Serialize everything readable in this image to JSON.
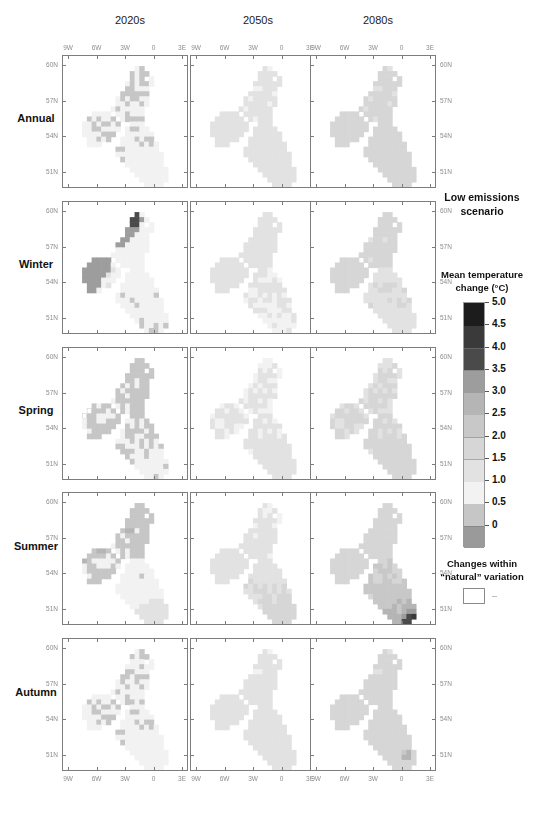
{
  "figure": {
    "columns": [
      "2020s",
      "2050s",
      "2080s"
    ],
    "rows": [
      "Annual",
      "Winter",
      "Spring",
      "Summer",
      "Autumn"
    ],
    "x_ticks": [
      "9W",
      "6W",
      "3W",
      "0",
      "3E"
    ],
    "y_ticks": [
      "60N",
      "57N",
      "54N",
      "51N"
    ]
  },
  "legend": {
    "scenario_line1": "Low emissions",
    "scenario_line2": "scenario",
    "colorbar_title_line1": "Mean temperature",
    "colorbar_title_line2": "change (°C)",
    "colorbar_labels": [
      "5.0",
      "4.5",
      "4.0",
      "3.5",
      "3.0",
      "2.5",
      "2.0",
      "1.5",
      "1.0",
      "0.5",
      "0"
    ],
    "natural_line1": "Changes within",
    "natural_line2": "“natural” variation",
    "natural_dash": "–"
  },
  "chart_data": {
    "type": "heatmap",
    "subtitle": "Mean temperature change (°C)",
    "xlabel": "",
    "ylabel": "",
    "region": "United Kingdom and Ireland",
    "columns": [
      "2020s",
      "2050s",
      "2080s"
    ],
    "rows": [
      "Annual",
      "Winter",
      "Spring",
      "Summer",
      "Autumn"
    ],
    "x_ticks": [
      "9W",
      "6W",
      "3W",
      "0",
      "3E"
    ],
    "y_ticks": [
      "60N",
      "57N",
      "54N",
      "51N"
    ],
    "xlim": [
      -11.0,
      4.0
    ],
    "ylim": [
      49.5,
      61.0
    ],
    "grid": false,
    "legend_position": "right",
    "colorbar": {
      "levels": [
        0,
        0.5,
        1.0,
        1.5,
        2.0,
        2.5,
        3.0,
        3.5,
        4.0,
        4.5,
        5.0
      ],
      "units": "°C",
      "colors_low_to_high": [
        "#9a9a9a",
        "#c6c6c6",
        "#f2f2f2",
        "#e2e2e2",
        "#d6d6d6",
        "#c8c8c8",
        "#b5b5b5",
        "#9d9d9d",
        "#4a4a4a",
        "#3a3a3a",
        "#1c1c1c"
      ]
    },
    "panel_mean_change_celsius": {
      "Annual": {
        "2020s": 1.1,
        "2050s": 1.7,
        "2080s": 2.2
      },
      "Winter": {
        "2020s": 1.2,
        "2050s": 1.6,
        "2080s": 2.0
      },
      "Spring": {
        "2020s": 1.0,
        "2050s": 1.6,
        "2080s": 2.1
      },
      "Summer": {
        "2020s": 1.2,
        "2050s": 1.9,
        "2080s": 2.6
      },
      "Autumn": {
        "2020s": 1.1,
        "2050s": 1.7,
        "2080s": 2.2
      }
    },
    "panel_range_celsius": {
      "Annual": {
        "2020s": [
          0.5,
          1.5
        ],
        "2050s": [
          1.0,
          2.0
        ],
        "2080s": [
          1.5,
          2.5
        ]
      },
      "Winter": {
        "2020s": [
          0.5,
          4.0
        ],
        "2050s": [
          1.0,
          2.5
        ],
        "2080s": [
          1.5,
          2.5
        ]
      },
      "Spring": {
        "2020s": [
          0.5,
          1.5
        ],
        "2050s": [
          1.0,
          2.0
        ],
        "2080s": [
          1.5,
          2.5
        ]
      },
      "Summer": {
        "2020s": [
          0.5,
          3.5
        ],
        "2050s": [
          1.0,
          2.5
        ],
        "2080s": [
          1.5,
          5.0
        ]
      },
      "Autumn": {
        "2020s": [
          0.5,
          1.5
        ],
        "2050s": [
          1.0,
          2.0
        ],
        "2080s": [
          1.5,
          3.0
        ]
      }
    },
    "notes": [
      "Warming increases from the 2020s to the 2080s in every season.",
      "Summer 2080s shows the largest warming, peaking above 4.5 °C in south-east England.",
      "Winter 2020s shows locally high values over Ireland and northern Scotland.",
      "White grid cells denote changes within “natural” variation."
    ]
  }
}
